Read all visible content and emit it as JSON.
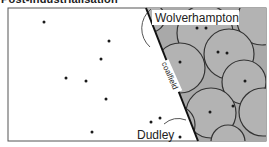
{
  "title": "Post-industrialisation",
  "map": {
    "labels": {
      "wolverhampton": "Wolverhampton",
      "dudley": "Dudley",
      "coalfield": "coalfield"
    },
    "colors": {
      "coalfield_fill": "#a9a9a9",
      "circle_fill": "#b4b4b4",
      "circle_stroke": "#333333",
      "background": "#ffffff",
      "dot": "#1a1a1a"
    },
    "off_coalfield_dots": 7,
    "coalfield_circle_centers_with_dots": 8
  }
}
